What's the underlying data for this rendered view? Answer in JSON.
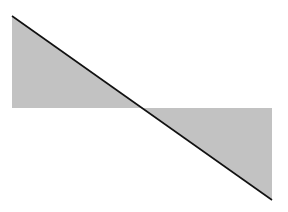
{
  "diagram": {
    "width": 288,
    "height": 212,
    "background": "#ffffff",
    "fill_color": "#c2c2c2",
    "line_color": "#111111",
    "baseline_y": 108,
    "line": {
      "x1": 12,
      "y1": 16,
      "x2": 272,
      "y2": 200
    },
    "crossing_x": 142,
    "shapes": [
      {
        "name": "upper-left-triangle",
        "points": "12,16 12,108 142,108"
      },
      {
        "name": "lower-right-triangle",
        "points": "142,108 272,108 272,200"
      }
    ]
  }
}
